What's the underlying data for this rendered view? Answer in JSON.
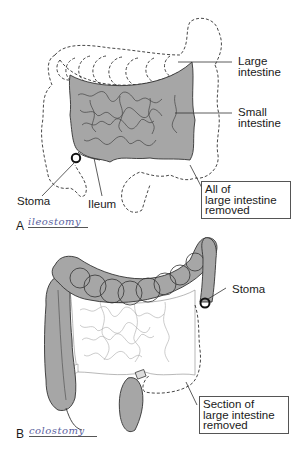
{
  "figure": {
    "panel_a": {
      "letter": "A",
      "handwritten_caption": "ileostomy",
      "labels": {
        "large_intestine_1": "Large",
        "large_intestine_2": "intestine",
        "small_intestine_1": "Small",
        "small_intestine_2": "intestine",
        "stoma": "Stoma",
        "ileum": "Ileum"
      },
      "callout_box": {
        "line1": "All of",
        "line2": "large intestine",
        "line3": "removed"
      }
    },
    "panel_b": {
      "letter": "B",
      "handwritten_caption": "colostomy",
      "labels": {
        "stoma": "Stoma"
      },
      "callout_box": {
        "line1": "Section of",
        "line2": "large intestine",
        "line3": "removed"
      }
    },
    "colors": {
      "tissue_fill": "#a6a6a6",
      "outline": "#222222",
      "removed_dashed": "#333333",
      "caption_ink": "#5a5fa0"
    }
  }
}
